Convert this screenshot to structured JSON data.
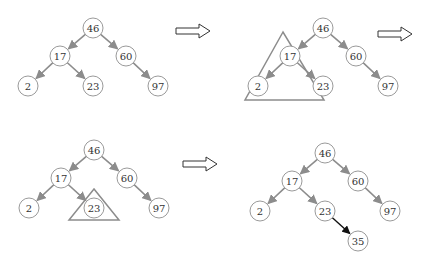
{
  "colors": {
    "node_stroke": "#9a9a9a",
    "edge": "#8c8c8c",
    "new_edge": "#111111",
    "highlight": "#8c8c8c"
  },
  "panels": [
    {
      "id": "step1",
      "nodes": [
        "46",
        "17",
        "60",
        "2",
        "23",
        "97"
      ],
      "highlight": null
    },
    {
      "id": "step2",
      "nodes": [
        "46",
        "17",
        "60",
        "2",
        "23",
        "97"
      ],
      "highlight": "left-subtree"
    },
    {
      "id": "step3",
      "nodes": [
        "46",
        "17",
        "60",
        "2",
        "23",
        "97"
      ],
      "highlight": "node-23"
    },
    {
      "id": "step4",
      "nodes": [
        "46",
        "17",
        "60",
        "2",
        "23",
        "97",
        "35"
      ],
      "highlight": null,
      "inserted": "35"
    }
  ],
  "arrows": [
    {
      "icon": "right-arrow-icon"
    },
    {
      "icon": "right-arrow-icon"
    },
    {
      "icon": "right-arrow-icon"
    }
  ]
}
